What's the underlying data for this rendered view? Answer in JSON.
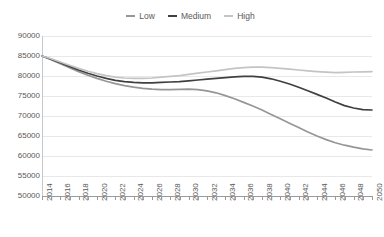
{
  "chart_data": {
    "type": "line",
    "title": "",
    "subtitle": "",
    "xlabel": "",
    "ylabel": "",
    "grid": true,
    "legend_position": "top-center",
    "ylim": [
      50000,
      90000
    ],
    "ytick_values": [
      90000,
      85000,
      80000,
      75000,
      70000,
      65000,
      60000,
      55000,
      50000
    ],
    "ytick_labels": [
      "90000",
      "85000",
      "80000",
      "75000",
      "70000",
      "65000",
      "60000",
      "55000",
      "50000"
    ],
    "xlim": [
      2014,
      2050
    ],
    "x": [
      2014,
      2015,
      2016,
      2017,
      2018,
      2019,
      2020,
      2021,
      2022,
      2023,
      2024,
      2025,
      2026,
      2027,
      2028,
      2029,
      2030,
      2031,
      2032,
      2033,
      2034,
      2035,
      2036,
      2037,
      2038,
      2039,
      2040,
      2041,
      2042,
      2043,
      2044,
      2045,
      2046,
      2047,
      2048,
      2049,
      2050
    ],
    "xtick_labels": [
      "2014",
      "2016",
      "2018",
      "2020",
      "2022",
      "2024",
      "2026",
      "2028",
      "2030",
      "2032",
      "2034",
      "2036",
      "2038",
      "2040",
      "2042",
      "2044",
      "2046",
      "2048",
      "2050"
    ],
    "series": [
      {
        "name": "Low",
        "color": "#969696",
        "values": [
          85000,
          84100,
          83100,
          82100,
          81100,
          80200,
          79400,
          78700,
          78100,
          77600,
          77200,
          76900,
          76700,
          76600,
          76600,
          76650,
          76700,
          76600,
          76300,
          75800,
          75100,
          74300,
          73400,
          72500,
          71500,
          70400,
          69300,
          68200,
          67100,
          66000,
          65000,
          64100,
          63300,
          62700,
          62200,
          61800,
          61500
        ]
      },
      {
        "name": "Medium",
        "color": "#404040",
        "values": [
          85000,
          84200,
          83300,
          82400,
          81500,
          80700,
          80000,
          79400,
          78900,
          78600,
          78400,
          78300,
          78300,
          78400,
          78500,
          78600,
          78800,
          79000,
          79200,
          79400,
          79600,
          79800,
          79900,
          79900,
          79700,
          79300,
          78700,
          78000,
          77200,
          76300,
          75400,
          74500,
          73500,
          72600,
          72000,
          71600,
          71500
        ]
      },
      {
        "name": "High",
        "color": "#c4c4c4",
        "values": [
          85000,
          84300,
          83500,
          82700,
          81900,
          81200,
          80600,
          80100,
          79700,
          79500,
          79400,
          79400,
          79500,
          79700,
          79900,
          80100,
          80400,
          80700,
          81000,
          81300,
          81600,
          81900,
          82100,
          82200,
          82200,
          82100,
          81900,
          81700,
          81500,
          81300,
          81100,
          80950,
          80850,
          80900,
          81000,
          81050,
          81100
        ]
      }
    ]
  }
}
